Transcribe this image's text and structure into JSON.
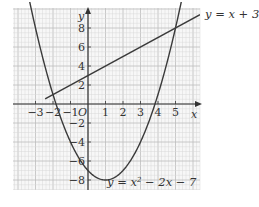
{
  "chart_data": {
    "type": "line",
    "title": "",
    "xlabel": "x",
    "ylabel": "y",
    "origin_label": "O",
    "xlim": [
      -4.3,
      6.4
    ],
    "ylim": [
      -9.0,
      10.1
    ],
    "grid": true,
    "x_ticks": [
      -3,
      -2,
      -1,
      1,
      2,
      3,
      4,
      5
    ],
    "x_tick_labels": [
      "−3",
      "−2",
      "−1",
      "1",
      "2",
      "3",
      "4",
      "5"
    ],
    "y_ticks": [
      8,
      6,
      4,
      2,
      -2,
      -4,
      -6,
      -8
    ],
    "y_tick_labels": [
      "8",
      "6",
      "4",
      "2",
      "−2",
      "−4",
      "−6",
      "−8"
    ],
    "series": [
      {
        "name": "y = x + 3",
        "kind": "linear",
        "equation": "y = x + 3",
        "coefficients": {
          "m": 1,
          "c": 3
        },
        "label_position": "right-outside"
      },
      {
        "name": "y = x² − 2x − 7",
        "kind": "quadratic",
        "equation": "y = x² − 2x − 7",
        "coefficients": {
          "a": 1,
          "b": -2,
          "c": -7
        },
        "vertex": [
          1,
          -8
        ],
        "label_position": "bottom-inside"
      }
    ],
    "intersections": [
      [
        -2,
        1
      ],
      [
        5,
        8
      ]
    ],
    "colors": {
      "grid_minor": "#d9d9d9",
      "grid_major": "#bdbdbd",
      "axis": "#333333",
      "curve": "#3a3a3a",
      "background": "#f7f7f7"
    }
  },
  "labels": {
    "line_equation": "y = x + 3",
    "parabola_equation_prefix": "y = x",
    "parabola_equation_power": "2",
    "parabola_equation_suffix": " − 2x − 7",
    "x_axis": "x",
    "y_axis": "y",
    "origin": "O"
  }
}
